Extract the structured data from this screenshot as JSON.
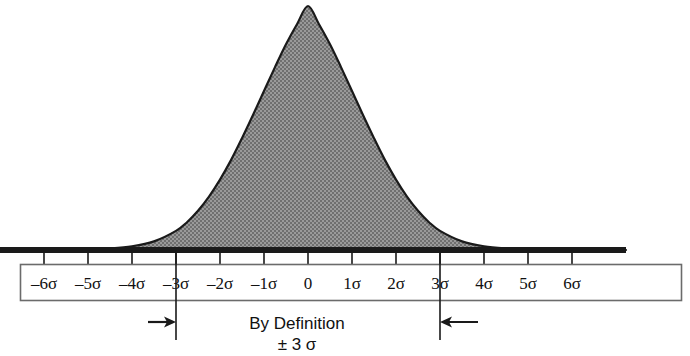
{
  "chart_data": {
    "type": "area",
    "title": "",
    "subtitle": "",
    "xlabel": "",
    "ylabel": "",
    "grid": false,
    "legend": null,
    "xlim": [
      -6.8,
      6.8
    ],
    "ylim": [
      0,
      1
    ],
    "curve": {
      "name": "normal-distribution",
      "mean": 0,
      "sigma": 1.0,
      "peak_value": 1.0,
      "fill_color": "#8a8a8a",
      "line_color": "#1a1a1a"
    },
    "tick_labels": [
      "–6σ",
      "–5σ",
      "–4σ",
      "–3σ",
      "–2σ",
      "–1σ",
      "0",
      "1σ",
      "2σ",
      "3σ",
      "4σ",
      "5σ",
      "6σ"
    ],
    "tick_values": [
      -6,
      -5,
      -4,
      -3,
      -2,
      -1,
      0,
      1,
      2,
      3,
      4,
      5,
      6
    ],
    "x": [
      -6.8,
      -6.5,
      -6,
      -5.5,
      -5,
      -4.5,
      -4,
      -3.5,
      -3,
      -2.75,
      -2.5,
      -2.25,
      -2,
      -1.75,
      -1.5,
      -1.25,
      -1,
      -0.75,
      -0.5,
      -0.25,
      0,
      0.25,
      0.5,
      0.75,
      1,
      1.25,
      1.5,
      1.75,
      2,
      2.25,
      2.5,
      2.75,
      3,
      3.5,
      4,
      4.5,
      5,
      5.5,
      6,
      6.5,
      6.8
    ],
    "y": [
      0,
      0,
      0,
      0,
      0.002,
      0.005,
      0.012,
      0.028,
      0.062,
      0.09,
      0.127,
      0.173,
      0.228,
      0.291,
      0.362,
      0.437,
      0.515,
      0.592,
      0.666,
      0.731,
      0.79,
      0.731,
      0.666,
      0.592,
      0.515,
      0.437,
      0.362,
      0.291,
      0.228,
      0.173,
      0.127,
      0.09,
      0.062,
      0.028,
      0.012,
      0.005,
      0.002,
      0,
      0,
      0,
      0
    ],
    "annotations": [
      {
        "name": "by-definition",
        "line1": "By Definition",
        "line2": "± 3 σ",
        "bounds": [
          -3,
          3
        ],
        "marker_lines": [
          -3,
          3
        ],
        "arrows": [
          "right",
          "left"
        ]
      }
    ]
  },
  "axis_strip": {
    "ticks": [
      {
        "label": "–6σ",
        "value": -6
      },
      {
        "label": "–5σ",
        "value": -5
      },
      {
        "label": "–4σ",
        "value": -4
      },
      {
        "label": "–3σ",
        "value": -3
      },
      {
        "label": "–2σ",
        "value": -2
      },
      {
        "label": "–1σ",
        "value": -1
      },
      {
        "label": "0",
        "value": 0
      },
      {
        "label": "1σ",
        "value": 1
      },
      {
        "label": "2σ",
        "value": 2
      },
      {
        "label": "3σ",
        "value": 3
      },
      {
        "label": "4σ",
        "value": 4
      },
      {
        "label": "5σ",
        "value": 5
      },
      {
        "label": "6σ",
        "value": 6
      }
    ]
  },
  "caption": {
    "line1": "By Definition",
    "line2": "± 3 σ"
  },
  "colors": {
    "background": "#ffffff",
    "curve_fill": "#8a8a8a",
    "curve_stroke": "#1a1a1a",
    "baseline": "#1a1a1a",
    "box_border": "#6b6b6b",
    "text": "#111111"
  }
}
